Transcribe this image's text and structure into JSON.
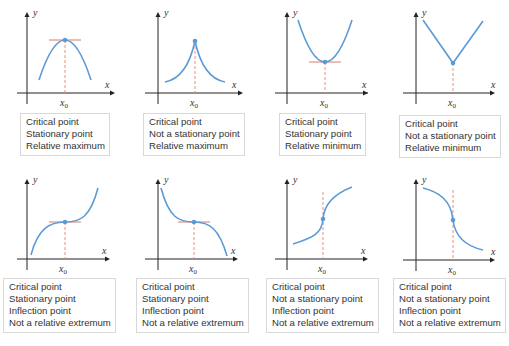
{
  "figure": {
    "axis_labels": {
      "x": "x",
      "y": "y",
      "x0": "x",
      "x0_sub": "0"
    },
    "colors": {
      "curve": "#5b9bd5",
      "tangent": "#e07a6a",
      "dashed": "#e8907f",
      "axis": "#222222",
      "caption_border": "#d8d8d8"
    },
    "panels": [
      {
        "id": "p1",
        "lines": [
          "Critical point",
          "Stationary point",
          "Relative maximum"
        ]
      },
      {
        "id": "p2",
        "lines": [
          "Critical point",
          "Not a stationary point",
          "Relative maximum"
        ]
      },
      {
        "id": "p3",
        "lines": [
          "Critical point",
          "Stationary point",
          "Relative minimum"
        ]
      },
      {
        "id": "p4",
        "lines": [
          "Critical point",
          "Not a stationary point",
          "Relative minimum"
        ]
      },
      {
        "id": "p5",
        "lines": [
          "Critical point",
          "Stationary point",
          "Inflection point",
          "Not a relative extremum"
        ]
      },
      {
        "id": "p6",
        "lines": [
          "Critical point",
          "Stationary point",
          "Inflection point",
          "Not a relative extremum"
        ]
      },
      {
        "id": "p7",
        "lines": [
          "Critical point",
          "Not a stationary point",
          "Inflection point",
          "Not a relative extremum"
        ]
      },
      {
        "id": "p8",
        "lines": [
          "Critical point",
          "Not a stationary point",
          "Inflection point",
          "Not a relative extremum"
        ]
      }
    ]
  }
}
